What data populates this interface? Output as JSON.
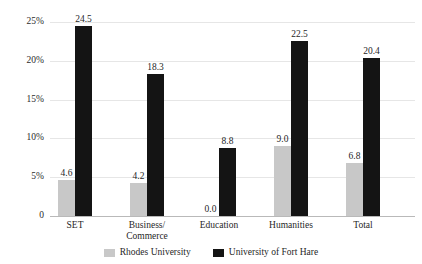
{
  "chart_data": {
    "type": "bar",
    "title": "",
    "xlabel": "",
    "ylabel": "",
    "ylim": [
      0,
      25
    ],
    "grid": true,
    "legend_position": "bottom",
    "categories": [
      "SET",
      "Business/\nCommerce",
      "Education",
      "Humanities",
      "Total"
    ],
    "ytick_labels": [
      "0",
      "5%",
      "10%",
      "15%",
      "20%",
      "25%"
    ],
    "ytick_values": [
      0,
      5,
      10,
      15,
      20,
      25
    ],
    "series": [
      {
        "name": "Rhodes University",
        "color": "#c8c8c8",
        "values": [
          4.6,
          4.2,
          0.0,
          9.0,
          6.8
        ],
        "labels": [
          "4.6",
          "4.2",
          "0.0",
          "9.0",
          "6.8"
        ]
      },
      {
        "name": "University of Fort Hare",
        "color": "#141414",
        "values": [
          24.5,
          18.3,
          8.8,
          22.5,
          20.4
        ],
        "labels": [
          "24.5",
          "18.3",
          "8.8",
          "22.5",
          "20.4"
        ]
      }
    ]
  },
  "title_remnant": {
    "left_fragment": "",
    "right_fragment": ""
  }
}
